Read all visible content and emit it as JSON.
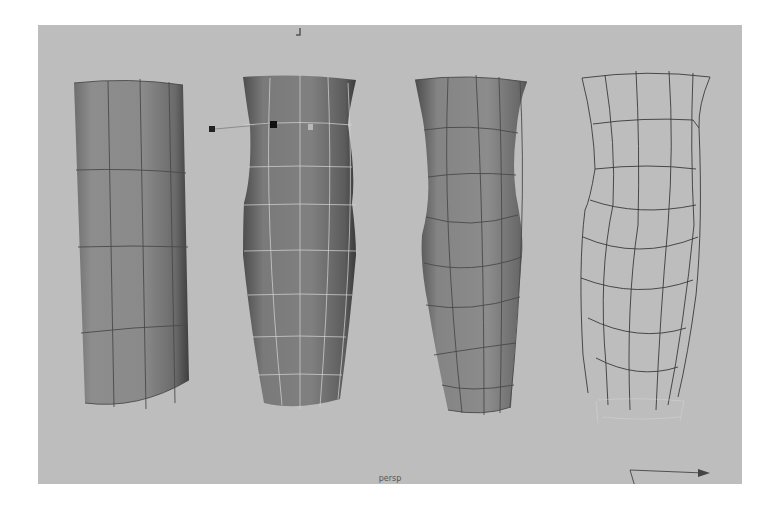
{
  "viewport": {
    "camera_label": "persp",
    "background_color": "#bdbdbd"
  },
  "objects": [
    {
      "name": "cylinder-original",
      "display": "shaded-wireframe",
      "wire_color": "#4a4a4a"
    },
    {
      "name": "cylinder-lattice-deformed",
      "display": "shaded-selected",
      "wire_color": "#d8d8d8"
    },
    {
      "name": "cylinder-deformed-result",
      "display": "shaded-wireframe",
      "wire_color": "#4a4a4a"
    },
    {
      "name": "lattice-cage",
      "display": "wireframe",
      "wire_color": "#3a3a3a"
    }
  ],
  "handles": [
    {
      "name": "lattice-point-handle-a"
    },
    {
      "name": "lattice-point-handle-b"
    },
    {
      "name": "lattice-point-handle-c"
    }
  ],
  "manipulator": {
    "name": "move-manipulator"
  }
}
